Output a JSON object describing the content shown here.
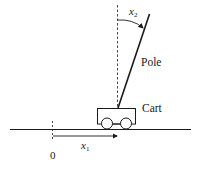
{
  "diagram": {
    "labels": {
      "pole": "Pole",
      "cart": "Cart",
      "origin": "0",
      "x1_base": "x",
      "x1_sub": "1",
      "x2_base": "x",
      "x2_sub": "2"
    },
    "elements": {
      "ground_line": "horizontal ground",
      "reference_vertical": "dashed vertical reference through pivot",
      "origin_marker": "dashed vertical at origin",
      "pole": "pole tilted clockwise from vertical",
      "cart": "rectangular cart with two wheels",
      "x1_arrow": "arrow from origin to cart position",
      "x2_arc": "arc arrow for pole angle"
    },
    "colors": {
      "stroke": "#1a1a1a",
      "background": "#ffffff"
    }
  }
}
